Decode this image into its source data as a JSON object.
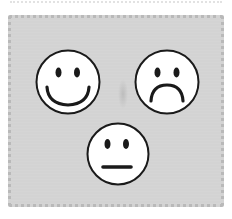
{
  "image": {
    "description": "Three emoji faces on a gray panel with a stitched border",
    "background_color": "#ffffff",
    "panel_color": "#d3d3d3",
    "panel_border_color": "#b9b9b9",
    "stroke_color": "#1a1a1a",
    "face_fill": "#ffffff"
  },
  "faces": [
    {
      "name": "happy",
      "expression": "smile"
    },
    {
      "name": "sad",
      "expression": "frown"
    },
    {
      "name": "neutral",
      "expression": "flat"
    }
  ]
}
